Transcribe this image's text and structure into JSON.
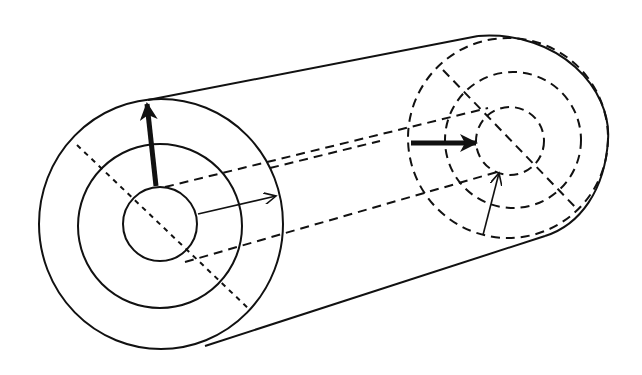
{
  "diagram": {
    "title": "",
    "colors": {
      "stroke": "#111111",
      "background": "#ffffff"
    },
    "elements": [
      {
        "id": "front-outer-circle",
        "style": "solid"
      },
      {
        "id": "front-middle-circle",
        "style": "solid"
      },
      {
        "id": "front-inner-circle",
        "style": "solid"
      },
      {
        "id": "cylinder-top-edge",
        "style": "solid"
      },
      {
        "id": "cylinder-bottom-edge",
        "style": "solid"
      },
      {
        "id": "back-face-outer-arc",
        "style": "solid"
      },
      {
        "id": "back-outer-circle",
        "style": "dashed"
      },
      {
        "id": "back-middle-circle",
        "style": "dashed"
      },
      {
        "id": "back-inner-circle",
        "style": "dashed"
      },
      {
        "id": "axis-lines",
        "style": "dashed"
      },
      {
        "id": "front-diagonal",
        "style": "dotted"
      },
      {
        "id": "back-diagonal",
        "style": "dashed"
      },
      {
        "id": "thick-arrow-up",
        "style": "thick"
      },
      {
        "id": "thin-arrow-right",
        "style": "thin"
      },
      {
        "id": "thick-arrow-back",
        "style": "thick"
      },
      {
        "id": "thin-arrow-back",
        "style": "thin"
      }
    ],
    "labels": []
  }
}
